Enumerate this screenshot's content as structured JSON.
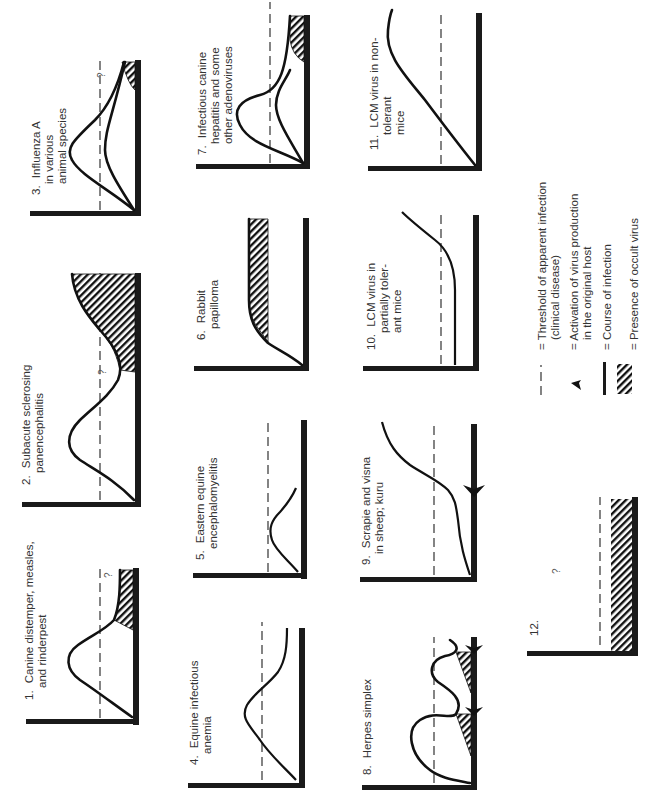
{
  "figure": {
    "orientation": "rotated-90-ccw",
    "colors": {
      "ink": "#111111",
      "text": "#333333",
      "background": "#ffffff"
    },
    "panels": [
      {
        "id": 1,
        "number": "1.",
        "lines": [
          "Canine distemper, measles,",
          "and rinderpest"
        ],
        "question_mark": "?"
      },
      {
        "id": 2,
        "number": "2.",
        "lines": [
          "Subacute sclerosing",
          "panencephalitis"
        ],
        "question_mark": "?"
      },
      {
        "id": 3,
        "number": "3.",
        "lines": [
          "Influenza A",
          "in various",
          "animal species"
        ],
        "question_mark": "?"
      },
      {
        "id": 4,
        "number": "4.",
        "lines": [
          "Equine infectious",
          "anemia"
        ]
      },
      {
        "id": 5,
        "number": "5.",
        "lines": [
          "Eastern equine",
          "encephalomyelitis"
        ]
      },
      {
        "id": 6,
        "number": "6.",
        "lines": [
          "Rabbit",
          "papilloma"
        ]
      },
      {
        "id": 7,
        "number": "7.",
        "lines": [
          "Infectious canine",
          "hepatitis and some",
          "other adenoviruses"
        ]
      },
      {
        "id": 8,
        "number": "8.",
        "lines": [
          "Herpes simplex"
        ]
      },
      {
        "id": 9,
        "number": "9.",
        "lines": [
          "Scrapie and visna",
          "in sheep; kuru"
        ]
      },
      {
        "id": 10,
        "number": "10.",
        "lines": [
          "LCM virus in",
          "partially toler-",
          "ant mice"
        ]
      },
      {
        "id": 11,
        "number": "11.",
        "lines": [
          "LCM virus in non-",
          "tolerant",
          "mice"
        ]
      },
      {
        "id": 12,
        "number": "12.",
        "lines": [],
        "question_mark": "?"
      }
    ],
    "legend": [
      {
        "symbol": "dashed-line",
        "text": [
          "= Threshold of apparent infection",
          "(clinical disease)"
        ]
      },
      {
        "symbol": "arrowhead",
        "text": [
          "= Activation of virus production",
          "in the original host"
        ]
      },
      {
        "symbol": "solid-line",
        "text": [
          "= Course of infection"
        ]
      },
      {
        "symbol": "hatching",
        "text": [
          "= Presence of occult virus"
        ]
      }
    ]
  }
}
